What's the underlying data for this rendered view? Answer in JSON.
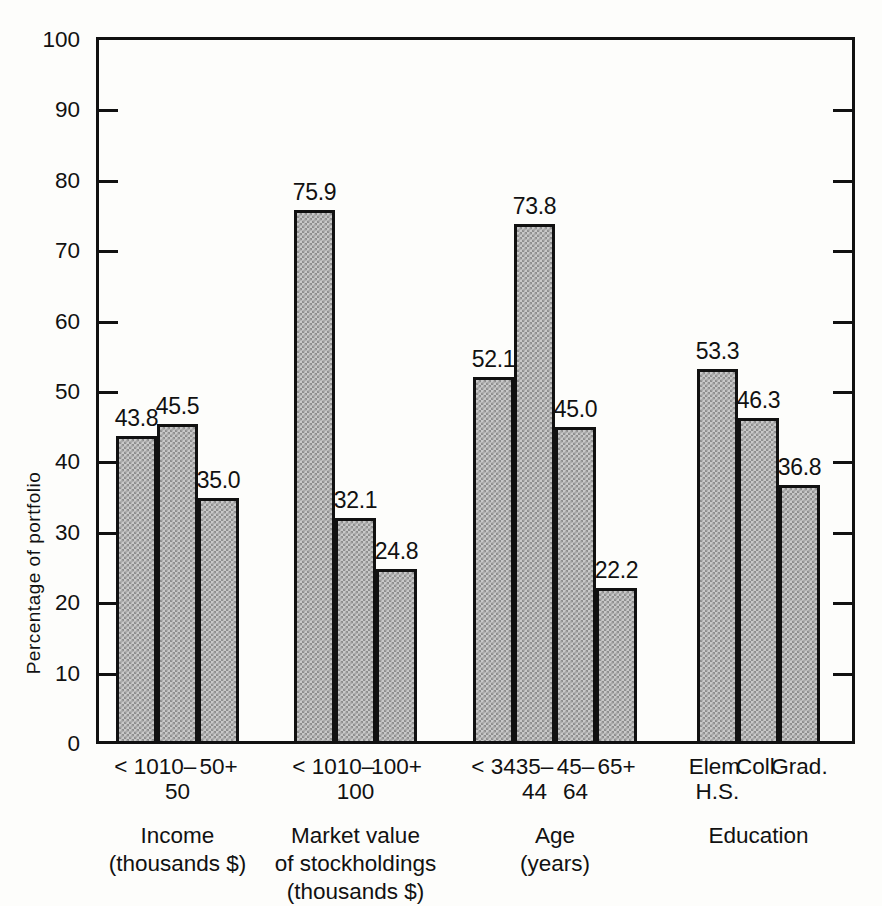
{
  "chart_data": {
    "type": "bar",
    "title": "",
    "xlabel": "",
    "ylabel": "Percentage of portfolio",
    "ylim": [
      0,
      100
    ],
    "yticks": [
      0,
      10,
      20,
      30,
      40,
      50,
      60,
      70,
      80,
      90,
      100
    ],
    "ytick_labels": [
      "0",
      "10",
      "20",
      "30",
      "40",
      "50",
      "60",
      "70",
      "80",
      "90",
      "100"
    ],
    "grid": false,
    "legend": "none",
    "value_label_format": "one-decimal",
    "right_axis_ticks": true,
    "groups": [
      {
        "name": "Income",
        "unit": "(thousands $)",
        "categories": [
          "< 10",
          "10– 50",
          "50+"
        ],
        "category_lines": [
          [
            "< 10",
            ""
          ],
          [
            "10–",
            "50"
          ],
          [
            "50+",
            ""
          ]
        ],
        "values": [
          43.8,
          45.5,
          35.0
        ],
        "value_labels": [
          "43.8",
          "45.5",
          "35.0"
        ]
      },
      {
        "name": "Market value of stockholdings",
        "unit": "(thousands $)",
        "name_lines": [
          "Market value",
          "of stockholdings"
        ],
        "categories": [
          "< 10",
          "10– 100",
          "100+"
        ],
        "category_lines": [
          [
            "< 10",
            ""
          ],
          [
            "10–",
            "100"
          ],
          [
            "100+",
            ""
          ]
        ],
        "values": [
          75.9,
          32.1,
          24.8
        ],
        "value_labels": [
          "75.9",
          "32.1",
          "24.8"
        ]
      },
      {
        "name": "Age",
        "unit": "(years)",
        "categories": [
          "< 34",
          "35– 44",
          "45– 64",
          "65+"
        ],
        "category_lines": [
          [
            "< 34",
            ""
          ],
          [
            "35–",
            "44"
          ],
          [
            "45–",
            "64"
          ],
          [
            "65+",
            ""
          ]
        ],
        "values": [
          52.1,
          73.8,
          45.0,
          22.2
        ],
        "value_labels": [
          "52.1",
          "73.8",
          "45.0",
          "22.2"
        ]
      },
      {
        "name": "Education",
        "unit": "",
        "categories": [
          "Elem. H.S.",
          "Coll.",
          "Grad."
        ],
        "category_lines": [
          [
            "Elem.",
            "H.S."
          ],
          [
            "Coll.",
            ""
          ],
          [
            "Grad.",
            ""
          ]
        ],
        "values": [
          53.3,
          46.3,
          36.8
        ],
        "value_labels": [
          "53.3",
          "46.3",
          "36.8"
        ]
      }
    ]
  },
  "axis": {
    "y_title": "Percentage of portfolio",
    "ticks": [
      {
        "label": "100",
        "value": 100
      },
      {
        "label": "90",
        "value": 90
      },
      {
        "label": "80",
        "value": 80
      },
      {
        "label": "70",
        "value": 70
      },
      {
        "label": "60",
        "value": 60
      },
      {
        "label": "50",
        "value": 50
      },
      {
        "label": "40",
        "value": 40
      },
      {
        "label": "30",
        "value": 30
      },
      {
        "label": "20",
        "value": 20
      },
      {
        "label": "10",
        "value": 10
      },
      {
        "label": "0",
        "value": 0
      }
    ]
  },
  "style": {
    "ink": "#111111",
    "bar_fill": "#c9c9c9",
    "bar_pattern": "#8e8e8e",
    "paper": "#fdfdfb"
  }
}
